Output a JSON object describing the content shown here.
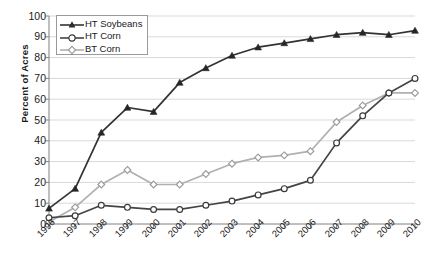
{
  "chart_data": {
    "type": "line",
    "title": "",
    "xlabel": "",
    "ylabel": "Percent of Acres",
    "ylim": [
      0,
      100
    ],
    "ytick_step": 10,
    "grid": true,
    "legend_position": "top-left",
    "categories": [
      "1996",
      "1997",
      "1998",
      "1999",
      "2000",
      "2001",
      "2002",
      "2003",
      "2004",
      "2005",
      "2006",
      "2007",
      "2008",
      "2009",
      "2010"
    ],
    "yticks": [
      "0",
      "10",
      "20",
      "30",
      "40",
      "50",
      "60",
      "70",
      "80",
      "90",
      "100"
    ],
    "series": [
      {
        "name": "HT Soybeans",
        "marker": "filled-triangle",
        "color": "#333333",
        "values": [
          7.5,
          17,
          44,
          56,
          54,
          68,
          75,
          81,
          85,
          87,
          89,
          91,
          92,
          91,
          93
        ]
      },
      {
        "name": "HT Corn",
        "marker": "open-circle",
        "color": "#444444",
        "values": [
          3,
          4,
          9,
          8,
          7,
          7,
          9,
          11,
          14,
          17,
          21,
          39,
          52,
          63,
          70
        ]
      },
      {
        "name": "BT Corn",
        "marker": "open-diamond",
        "color": "#b0b0b0",
        "values": [
          1,
          8,
          19,
          26,
          19,
          19,
          24,
          29,
          32,
          33,
          35,
          49,
          57,
          63,
          63
        ]
      }
    ]
  },
  "axis": {
    "y_title": "Percent of Acres"
  },
  "legend": {
    "items": [
      {
        "label": "HT Soybeans"
      },
      {
        "label": "HT Corn"
      },
      {
        "label": "BT Corn"
      }
    ]
  },
  "colors": {
    "series_dark": "#333333",
    "series_mid": "#444444",
    "series_light": "#b0b0b0",
    "grid": "#d9d9d9",
    "axis": "#808080",
    "background": "#ffffff"
  }
}
